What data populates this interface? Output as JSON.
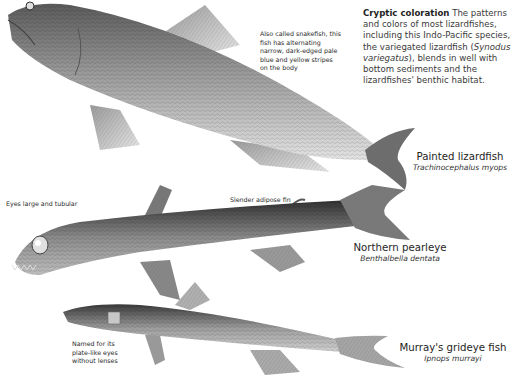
{
  "intro": {
    "title": "Cryptic coloration",
    "text_before_italic": " The patterns and colors of most lizardfishes, including this Indo-Pacific species, the variegated lizardfish (",
    "italic": "Synodus variegatus",
    "text_after_italic": "), blends in well with bottom sediments and the lizardfishes' benthic habitat."
  },
  "fishes": [
    {
      "common_name": "Painted lizardfish",
      "scientific_name": "Trachinocephalus myops",
      "annotations": [
        "Also called snakefish, this fish has alternating narrow, dark-edged pale blue and yellow stripes on the body"
      ]
    },
    {
      "common_name": "Northern pearleye",
      "scientific_name": "Benthalbella dentata",
      "annotations": [
        "Eyes large and tubular",
        "Slender adipose fin"
      ]
    },
    {
      "common_name": "Murray's grideye fish",
      "scientific_name": "Ipnops murrayi",
      "annotations": [
        "Named for its plate-like eyes without lenses"
      ]
    }
  ],
  "colors": {
    "background": "#ffffff",
    "text": "#231f20",
    "illustration_dark": "#3b3b3b",
    "illustration_mid": "#8c8c8c",
    "illustration_light": "#d6d6d6"
  }
}
